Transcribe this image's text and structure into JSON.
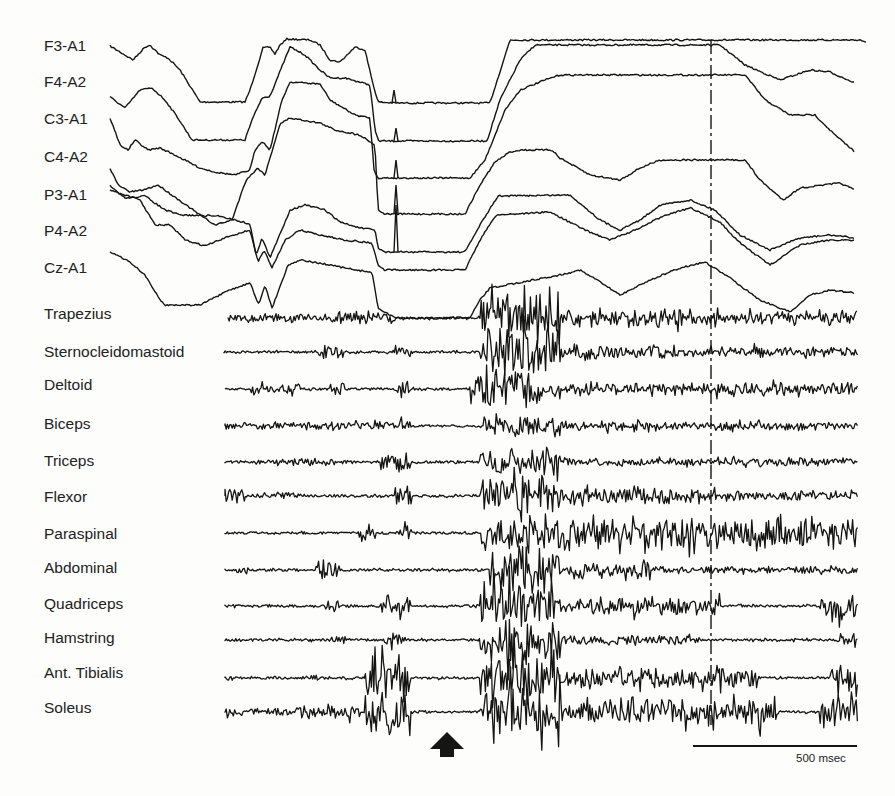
{
  "figure": {
    "eeg_channels": [
      {
        "label": "F3-A1",
        "label_y": 46
      },
      {
        "label": "F4-A2",
        "label_y": 82
      },
      {
        "label": "C3-A1",
        "label_y": 119
      },
      {
        "label": "C4-A2",
        "label_y": 157
      },
      {
        "label": "P3-A1",
        "label_y": 195
      },
      {
        "label": "P4-A2",
        "label_y": 231
      },
      {
        "label": "Cz-A1",
        "label_y": 268
      }
    ],
    "emg_channels": [
      {
        "label": "Trapezius",
        "label_y": 314
      },
      {
        "label": "Sternocleidomastoid",
        "label_y": 352
      },
      {
        "label": "Deltoid",
        "label_y": 385
      },
      {
        "label": "Biceps",
        "label_y": 424
      },
      {
        "label": "Triceps",
        "label_y": 461
      },
      {
        "label": "Flexor",
        "label_y": 497
      },
      {
        "label": "Paraspinal",
        "label_y": 534
      },
      {
        "label": "Abdominal",
        "label_y": 568
      },
      {
        "label": "Quadriceps",
        "label_y": 604
      },
      {
        "label": "Hamstring",
        "label_y": 638
      },
      {
        "label": "Ant. Tibialis",
        "label_y": 673
      },
      {
        "label": "Soleus",
        "label_y": 708
      }
    ],
    "scale_bar": {
      "label": "500 msec",
      "x1": 693,
      "x2": 857,
      "y": 746
    },
    "marker_line": {
      "x": 711,
      "y1": 40,
      "y2": 725,
      "style": "dash-dot"
    },
    "event_arrow": {
      "x": 447,
      "y": 732,
      "direction": "up"
    },
    "colors": {
      "trace": "#151515",
      "background": "#fdfdfc"
    }
  }
}
